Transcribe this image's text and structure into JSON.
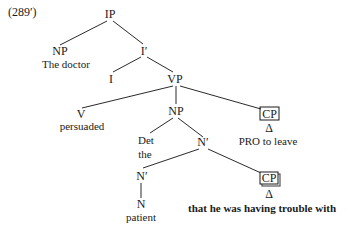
{
  "example_number": "(289′)",
  "nodes": {
    "ip": "IP",
    "np_subject": "NP",
    "np_subject_text": "The doctor",
    "i_bar": "I′",
    "i": "I",
    "vp": "VP",
    "v": "V",
    "v_text": "persuaded",
    "np_object": "NP",
    "cp_upper": "CP",
    "cp_upper_delta": "Δ",
    "cp_upper_text": "PRO to leave",
    "det": "Det",
    "det_text": "the",
    "n_bar_upper": "N′",
    "n_bar_lower": "N′",
    "cp_lower": "CP",
    "cp_lower_delta": "Δ",
    "cp_lower_text": "that he was having trouble with",
    "n": "N",
    "n_text": "patient"
  }
}
